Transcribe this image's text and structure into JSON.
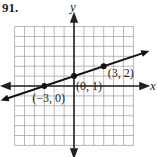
{
  "problem_number": "91.",
  "chart_data": {
    "type": "line",
    "title": "",
    "xlabel": "x",
    "ylabel": "y",
    "xlim": [
      -6,
      6
    ],
    "ylim": [
      -6,
      6
    ],
    "grid": true,
    "series": [
      {
        "name": "line",
        "x": [
          -3,
          0,
          3
        ],
        "y": [
          0,
          1,
          2
        ]
      }
    ],
    "points": [
      {
        "x": -3,
        "y": 0,
        "label": "(−3, 0)"
      },
      {
        "x": 0,
        "y": 1,
        "label": "(0, 1)"
      },
      {
        "x": 3,
        "y": 2,
        "label": "(3, 2)"
      }
    ]
  }
}
